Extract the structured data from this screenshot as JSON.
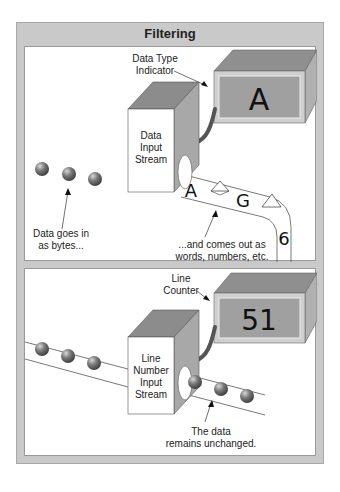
{
  "title": "Filtering",
  "panel_top": {
    "indicator_label_line1": "Data Type",
    "indicator_label_line2": "Indicator",
    "indicator_value": "A",
    "box_label_line1": "Data",
    "box_label_line2": "Input",
    "box_label_line3": "Stream",
    "input_caption_line1": "Data goes in",
    "input_caption_line2": "as bytes...",
    "output_caption_line1": "...and comes out as",
    "output_caption_line2": "words, numbers, etc.",
    "output_tokens": [
      "A",
      "G",
      "6"
    ]
  },
  "panel_bottom": {
    "counter_label_line1": "Line",
    "counter_label_line2": "Counter",
    "counter_value": "51",
    "box_label_line1": "Line",
    "box_label_line2": "Number",
    "box_label_line3": "Input",
    "box_label_line4": "Stream",
    "output_caption_line1": "The data",
    "output_caption_line2": "remains unchanged."
  },
  "colors": {
    "frame": "#c9c9c9",
    "box_top": "#8c8c8c",
    "box_side": "#a5a5a5",
    "display": "#9e9e9e",
    "cable": "#555555",
    "ball": "#6a6a6a"
  }
}
